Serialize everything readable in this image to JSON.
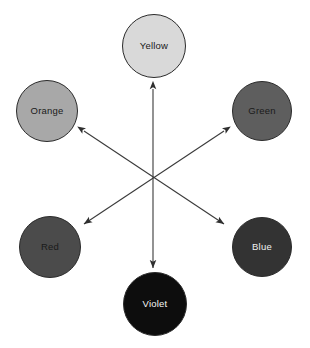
{
  "diagram": {
    "background_color": "#ffffff",
    "arrow_color": "#3a3a3a",
    "node_border_color": "#2b2b2b",
    "center": {
      "x": 153,
      "y": 177
    },
    "nodes": [
      {
        "id": "yellow",
        "label": "Yellow",
        "fill": "#d9d9d9",
        "text_color": "#1a1a1a",
        "cx": 154,
        "cy": 46,
        "r": 32
      },
      {
        "id": "orange",
        "label": "Orange",
        "fill": "#a8a8a8",
        "text_color": "#1a1a1a",
        "cx": 47,
        "cy": 111,
        "r": 31
      },
      {
        "id": "green",
        "label": "Green",
        "fill": "#5e5e5e",
        "text_color": "#1a1a1a",
        "cx": 262,
        "cy": 111,
        "r": 30
      },
      {
        "id": "red",
        "label": "Red",
        "fill": "#4b4b4b",
        "text_color": "#1a1a1a",
        "cx": 50,
        "cy": 247,
        "r": 31
      },
      {
        "id": "blue",
        "label": "Blue",
        "fill": "#333333",
        "text_color": "#f0f0f0",
        "cx": 262,
        "cy": 247,
        "r": 30
      },
      {
        "id": "violet",
        "label": "Violet",
        "fill": "#0d0d0d",
        "text_color": "#f5f5f5",
        "cx": 155,
        "cy": 304,
        "r": 32
      }
    ],
    "arrows": [
      {
        "id": "yellow-violet",
        "from_label": "Yellow",
        "to_label": "Violet",
        "x1": 153,
        "y1": 89,
        "x2": 153,
        "y2": 268
      },
      {
        "id": "orange-blue",
        "from_label": "Orange",
        "to_label": "Blue",
        "x1": 84,
        "y1": 131,
        "x2": 224,
        "y2": 224
      },
      {
        "id": "green-red",
        "from_label": "Green",
        "to_label": "Red",
        "x1": 224,
        "y1": 131,
        "x2": 84,
        "y2": 224
      }
    ]
  }
}
